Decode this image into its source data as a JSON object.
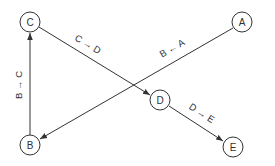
{
  "diagram": {
    "type": "directed-graph",
    "nodes": [
      {
        "id": "C",
        "label": "C",
        "x": 30,
        "y": 22
      },
      {
        "id": "A",
        "label": "A",
        "x": 242,
        "y": 22
      },
      {
        "id": "D",
        "label": "D",
        "x": 160,
        "y": 100
      },
      {
        "id": "B",
        "label": "B",
        "x": 30,
        "y": 145
      },
      {
        "id": "E",
        "label": "E",
        "x": 233,
        "y": 147
      }
    ],
    "edges": [
      {
        "from": "B",
        "to": "C",
        "label": "B → C"
      },
      {
        "from": "C",
        "to": "D",
        "label": "C → D"
      },
      {
        "from": "A",
        "to": "B",
        "label": "B ← A"
      },
      {
        "from": "D",
        "to": "E",
        "label": "D → E"
      }
    ],
    "colors": {
      "stroke": "#333333",
      "background": "#ffffff"
    }
  },
  "labels": {
    "node_c": "C",
    "node_a": "A",
    "node_d": "D",
    "node_b": "B",
    "node_e": "E",
    "edge_b_c": "B → C",
    "edge_c_d": "C → D",
    "edge_a_b": "B ← A",
    "edge_d_e": "D → E"
  }
}
